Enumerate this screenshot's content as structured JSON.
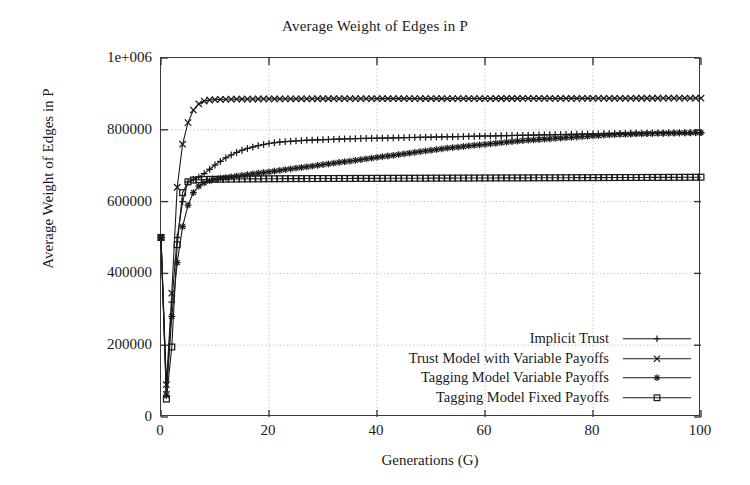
{
  "chart_data": {
    "type": "line",
    "title": "Average Weight of Edges in P",
    "xlabel": "Generations (G)",
    "ylabel": "Average Weight of Edges in P",
    "xlim": [
      0,
      100
    ],
    "ylim": [
      0,
      1000000
    ],
    "grid": true,
    "legend_position": "bottom-right inside plot",
    "xticks": [
      0,
      20,
      40,
      60,
      80,
      100
    ],
    "xtick_labels": [
      "0",
      "20",
      "40",
      "60",
      "80",
      "100"
    ],
    "yticks": [
      0,
      200000,
      400000,
      600000,
      800000,
      1000000
    ],
    "ytick_labels": [
      "0",
      "200000",
      "400000",
      "600000",
      "800000",
      "1e+006"
    ],
    "x": [
      0,
      1,
      2,
      3,
      4,
      5,
      6,
      7,
      8,
      9,
      10,
      11,
      12,
      13,
      14,
      15,
      16,
      17,
      18,
      19,
      20,
      21,
      22,
      23,
      24,
      25,
      26,
      27,
      28,
      29,
      30,
      31,
      32,
      33,
      34,
      35,
      36,
      37,
      38,
      39,
      40,
      41,
      42,
      43,
      44,
      45,
      46,
      47,
      48,
      49,
      50,
      51,
      52,
      53,
      54,
      55,
      56,
      57,
      58,
      59,
      60,
      61,
      62,
      63,
      64,
      65,
      66,
      67,
      68,
      69,
      70,
      71,
      72,
      73,
      74,
      75,
      76,
      77,
      78,
      79,
      80,
      81,
      82,
      83,
      84,
      85,
      86,
      87,
      88,
      89,
      90,
      91,
      92,
      93,
      94,
      95,
      96,
      97,
      98,
      99,
      100
    ],
    "series": [
      {
        "name": "Implicit Trust",
        "marker": "plus",
        "values": [
          500000,
          70000,
          320000,
          500000,
          600000,
          655000,
          662000,
          668000,
          678000,
          690000,
          702000,
          712000,
          722000,
          730000,
          737000,
          743000,
          748000,
          752000,
          756000,
          759000,
          762000,
          764000,
          766000,
          767000,
          768000,
          769000,
          770000,
          771000,
          771500,
          772000,
          772500,
          773000,
          773500,
          774000,
          774500,
          775000,
          775500,
          775800,
          776000,
          776300,
          776600,
          776900,
          777200,
          777500,
          777800,
          778100,
          778400,
          778700,
          779000,
          779300,
          779600,
          779900,
          780200,
          780500,
          780800,
          781100,
          781400,
          781700,
          782000,
          782300,
          782600,
          782900,
          783200,
          783500,
          783800,
          784100,
          784400,
          784700,
          785000,
          785300,
          785600,
          785900,
          786200,
          786500,
          786800,
          787100,
          787400,
          787700,
          788000,
          788300,
          788600,
          788900,
          789200,
          789500,
          789800,
          790000,
          790200,
          790400,
          790600,
          790800,
          791000,
          791200,
          791300,
          791400,
          791500,
          791600,
          791700,
          791800,
          791900,
          792000,
          792000
        ]
      },
      {
        "name": "Trust Model with Variable Payoffs",
        "marker": "cross",
        "values": [
          500000,
          90000,
          345000,
          640000,
          760000,
          820000,
          855000,
          872000,
          880000,
          883000,
          884000,
          884500,
          885000,
          885200,
          885400,
          885500,
          885600,
          885700,
          885800,
          885900,
          886000,
          886050,
          886100,
          886150,
          886200,
          886250,
          886300,
          886350,
          886400,
          886450,
          886500,
          886520,
          886540,
          886560,
          886580,
          886600,
          886620,
          886640,
          886660,
          886680,
          886700,
          886720,
          886740,
          886760,
          886780,
          886800,
          886820,
          886840,
          886860,
          886880,
          886900,
          886920,
          886940,
          886960,
          886980,
          887000,
          887020,
          887040,
          887060,
          887080,
          887100,
          887120,
          887140,
          887160,
          887180,
          887200,
          887220,
          887240,
          887260,
          887280,
          887300,
          887320,
          887340,
          887360,
          887380,
          887400,
          887450,
          887500,
          887550,
          887600,
          887650,
          887700,
          887720,
          887740,
          887760,
          887780,
          887800,
          887820,
          887840,
          887860,
          887880,
          887900,
          887920,
          887940,
          887960,
          887980,
          888000,
          888000,
          888000,
          888000,
          888000
        ]
      },
      {
        "name": "Tagging Model Variable Payoffs",
        "marker": "asterisk",
        "values": [
          500000,
          60000,
          280000,
          430000,
          530000,
          590000,
          625000,
          643000,
          652000,
          658000,
          662000,
          665000,
          667000,
          669000,
          671000,
          673000,
          675000,
          677000,
          679000,
          681000,
          683000,
          685000,
          687000,
          689000,
          691000,
          693000,
          695000,
          697000,
          699000,
          701000,
          703000,
          705000,
          707000,
          709000,
          711000,
          713000,
          715000,
          717000,
          719000,
          721000,
          723000,
          725000,
          727000,
          729000,
          731000,
          733000,
          735000,
          737000,
          739000,
          741000,
          743000,
          745000,
          747000,
          749000,
          750500,
          752000,
          753500,
          755000,
          756500,
          758000,
          759500,
          761000,
          762500,
          764000,
          765500,
          767000,
          768500,
          770000,
          771000,
          772000,
          773000,
          774000,
          775000,
          776000,
          777000,
          778000,
          779000,
          780000,
          781000,
          782000,
          783000,
          784000,
          785000,
          785800,
          786400,
          787000,
          787500,
          788000,
          788400,
          788800,
          789200,
          789600,
          790000,
          790300,
          790600,
          790900,
          791200,
          791500,
          791700,
          791900,
          792000
        ]
      },
      {
        "name": "Tagging Model Fixed Payoffs",
        "marker": "square",
        "values": [
          500000,
          50000,
          195000,
          480000,
          625000,
          655000,
          660000,
          661000,
          661500,
          662000,
          662200,
          662400,
          662600,
          662800,
          663000,
          663100,
          663200,
          663300,
          663400,
          663500,
          663600,
          663700,
          663800,
          663900,
          664000,
          664050,
          664100,
          664150,
          664200,
          664250,
          664300,
          664350,
          664400,
          664450,
          664500,
          664550,
          664600,
          664650,
          664700,
          664750,
          664800,
          664850,
          664900,
          664950,
          665000,
          665050,
          665100,
          665150,
          665200,
          665250,
          665300,
          665350,
          665400,
          665450,
          665500,
          665550,
          665600,
          665650,
          665700,
          665750,
          665800,
          665850,
          665900,
          665950,
          666000,
          666050,
          666100,
          666150,
          666200,
          666250,
          666300,
          666350,
          666400,
          666450,
          666500,
          666550,
          666600,
          666650,
          666700,
          666750,
          666800,
          666850,
          666900,
          666950,
          667000,
          667050,
          667100,
          667150,
          667200,
          667250,
          667300,
          667350,
          667400,
          667450,
          667500,
          667550,
          667600,
          667700,
          667800,
          667900,
          668000
        ]
      }
    ]
  },
  "legend": {
    "items": [
      {
        "label": "Implicit Trust",
        "marker": "plus"
      },
      {
        "label": "Trust Model with Variable Payoffs",
        "marker": "cross"
      },
      {
        "label": "Tagging Model Variable Payoffs",
        "marker": "asterisk"
      },
      {
        "label": "Tagging Model Fixed Payoffs",
        "marker": "square"
      }
    ]
  },
  "colors": {
    "line": "#1a1a1a",
    "grid": "#9a9a9a",
    "frame": "#3a3a3a",
    "background": "#ffffff"
  }
}
